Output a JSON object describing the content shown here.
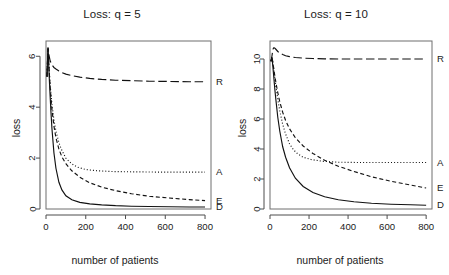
{
  "figure": {
    "panels": [
      {
        "id": "left",
        "title": "Loss: q = 5",
        "xlabel": "number of patients",
        "ylabel": "loss"
      },
      {
        "id": "right",
        "title": "Loss: q = 10",
        "xlabel": "number of patients",
        "ylabel": "loss"
      }
    ]
  },
  "ticks": {
    "x_left": [
      "0",
      "200",
      "400",
      "600",
      "800"
    ],
    "x_right": [
      "0",
      "200",
      "400",
      "600",
      "800"
    ],
    "y_left": [
      "0",
      "2",
      "4",
      "6"
    ],
    "y_right": [
      "0",
      "2",
      "4",
      "6",
      "8",
      "10"
    ]
  },
  "labels": {
    "left": {
      "R": "R",
      "A": "A",
      "E": "E",
      "D": "D"
    },
    "right": {
      "R": "R",
      "A": "A",
      "E": "E",
      "D": "D"
    }
  },
  "chart_data": [
    {
      "type": "line",
      "title": "Loss: q = 5",
      "xlabel": "number of patients",
      "ylabel": "loss",
      "xlim": [
        0,
        830
      ],
      "ylim": [
        0,
        6.6
      ],
      "xticks": [
        0,
        200,
        400,
        600,
        800
      ],
      "yticks": [
        0,
        2,
        4,
        6
      ],
      "grid": false,
      "legend_position": "right-edge-inline",
      "series": [
        {
          "name": "R",
          "label": "R",
          "linestyle": "long-dash",
          "x": [
            5,
            10,
            15,
            20,
            25,
            30,
            40,
            50,
            65,
            80,
            100,
            130,
            170,
            220,
            280,
            350,
            430,
            520,
            620,
            720,
            800
          ],
          "y": [
            5.2,
            6.35,
            6.05,
            5.85,
            5.74,
            5.66,
            5.56,
            5.5,
            5.42,
            5.36,
            5.3,
            5.24,
            5.18,
            5.13,
            5.09,
            5.06,
            5.04,
            5.02,
            5.01,
            5.0,
            5.0
          ]
        },
        {
          "name": "A",
          "label": "A",
          "linestyle": "dotted",
          "x": [
            5,
            10,
            15,
            20,
            25,
            30,
            40,
            50,
            65,
            80,
            100,
            120,
            140,
            160,
            200,
            260,
            340,
            440,
            560,
            680,
            800
          ],
          "y": [
            5.2,
            6.3,
            5.6,
            5.0,
            4.5,
            4.1,
            3.5,
            3.05,
            2.6,
            2.3,
            2.0,
            1.84,
            1.72,
            1.64,
            1.55,
            1.5,
            1.47,
            1.46,
            1.45,
            1.45,
            1.45
          ]
        },
        {
          "name": "E",
          "label": "E",
          "linestyle": "dashed",
          "x": [
            5,
            10,
            15,
            20,
            25,
            30,
            40,
            50,
            65,
            80,
            100,
            130,
            170,
            220,
            280,
            350,
            430,
            520,
            620,
            720,
            800
          ],
          "y": [
            5.2,
            6.3,
            5.55,
            4.9,
            4.35,
            3.9,
            3.25,
            2.8,
            2.35,
            2.05,
            1.78,
            1.5,
            1.25,
            1.03,
            0.86,
            0.72,
            0.6,
            0.5,
            0.43,
            0.37,
            0.33
          ]
        },
        {
          "name": "D",
          "label": "D",
          "linestyle": "solid",
          "x": [
            5,
            10,
            15,
            20,
            25,
            30,
            40,
            50,
            65,
            80,
            100,
            130,
            170,
            220,
            280,
            350,
            430,
            520,
            620,
            720,
            800
          ],
          "y": [
            5.2,
            6.3,
            5.4,
            4.55,
            3.8,
            3.15,
            2.2,
            1.6,
            1.05,
            0.75,
            0.52,
            0.36,
            0.26,
            0.2,
            0.16,
            0.13,
            0.11,
            0.1,
            0.09,
            0.08,
            0.08
          ]
        }
      ]
    },
    {
      "type": "line",
      "title": "Loss: q = 10",
      "xlabel": "number of patients",
      "ylabel": "loss",
      "xlim": [
        0,
        830
      ],
      "ylim": [
        0,
        11.2
      ],
      "xticks": [
        0,
        200,
        400,
        600,
        800
      ],
      "yticks": [
        0,
        2,
        4,
        6,
        8,
        10
      ],
      "grid": false,
      "legend_position": "right-edge-inline",
      "series": [
        {
          "name": "R",
          "label": "R",
          "linestyle": "long-dash",
          "x": [
            5,
            10,
            15,
            20,
            25,
            30,
            40,
            50,
            65,
            80,
            100,
            130,
            170,
            220,
            280,
            350,
            430,
            520,
            620,
            720,
            800
          ],
          "y": [
            9.85,
            10.2,
            10.65,
            10.75,
            10.72,
            10.65,
            10.5,
            10.4,
            10.3,
            10.22,
            10.16,
            10.1,
            10.06,
            10.03,
            10.01,
            10.0,
            10.0,
            10.0,
            10.0,
            10.0,
            10.0
          ]
        },
        {
          "name": "A",
          "label": "A",
          "linestyle": "dotted",
          "x": [
            5,
            10,
            15,
            20,
            25,
            30,
            40,
            50,
            65,
            80,
            100,
            120,
            140,
            170,
            210,
            270,
            350,
            450,
            560,
            680,
            800
          ],
          "y": [
            9.85,
            10.15,
            9.7,
            9.2,
            8.7,
            8.2,
            7.3,
            6.55,
            5.65,
            5.0,
            4.35,
            3.95,
            3.7,
            3.45,
            3.3,
            3.18,
            3.12,
            3.1,
            3.1,
            3.1,
            3.1
          ]
        },
        {
          "name": "E",
          "label": "E",
          "linestyle": "dashed",
          "x": [
            5,
            10,
            15,
            20,
            25,
            30,
            40,
            50,
            65,
            80,
            100,
            130,
            170,
            220,
            280,
            350,
            430,
            520,
            620,
            720,
            800
          ],
          "y": [
            9.85,
            10.15,
            9.75,
            9.3,
            8.85,
            8.45,
            7.75,
            7.15,
            6.45,
            5.9,
            5.35,
            4.75,
            4.2,
            3.7,
            3.25,
            2.85,
            2.5,
            2.15,
            1.85,
            1.6,
            1.4
          ]
        },
        {
          "name": "D",
          "label": "D",
          "linestyle": "solid",
          "x": [
            5,
            10,
            15,
            20,
            25,
            30,
            40,
            50,
            65,
            80,
            100,
            130,
            170,
            220,
            280,
            350,
            430,
            520,
            620,
            720,
            800
          ],
          "y": [
            9.85,
            10.1,
            9.45,
            8.7,
            7.95,
            7.3,
            6.1,
            5.2,
            4.15,
            3.45,
            2.75,
            2.05,
            1.5,
            1.1,
            0.82,
            0.62,
            0.48,
            0.38,
            0.32,
            0.28,
            0.25
          ]
        }
      ]
    }
  ]
}
